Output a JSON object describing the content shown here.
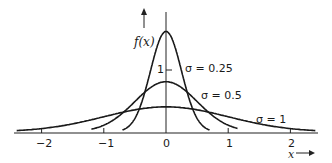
{
  "chart_data": {
    "type": "line",
    "title": "",
    "xlabel": "x",
    "ylabel": "f(x)",
    "xlim": [
      -2.4,
      2.4
    ],
    "ylim": [
      0,
      1.7
    ],
    "x_ticks": [
      "-2",
      "-1",
      "0",
      "1",
      "2"
    ],
    "y_ticks": [
      "1"
    ],
    "grid": false,
    "legend": "inline labels",
    "series": [
      {
        "name": "σ = 0.25",
        "sigma": 0.25,
        "x_range": [
          -0.7,
          0.7
        ],
        "peak": 1.596
      },
      {
        "name": "σ = 0.5",
        "sigma": 0.5,
        "x_range": [
          -1.2,
          1.15
        ],
        "peak": 0.798
      },
      {
        "name": "σ = 1",
        "sigma": 1,
        "x_range": [
          -2.4,
          2.4
        ],
        "peak": 0.399
      }
    ],
    "function": "normal density f(x) = (1/(σ√(2π))) exp(-x²/(2σ²))"
  },
  "labels": {
    "ylabel": "f(x)",
    "xlabel": "x",
    "ytick_1": "1",
    "xticks": [
      "−2",
      "−1",
      "0",
      "1",
      "2"
    ],
    "s025": "σ = 0.25",
    "s05": "σ = 0.5",
    "s1": "σ = 1"
  }
}
